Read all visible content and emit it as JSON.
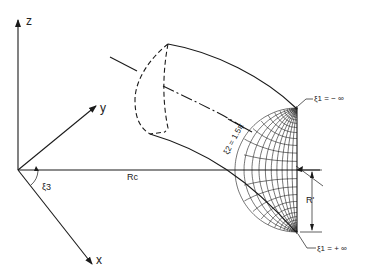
{
  "figure": {
    "axes": {
      "z_label": "z",
      "y_label": "y",
      "x_label": "x"
    },
    "labels": {
      "major_radius": "Rc",
      "angle": "ξ3",
      "minor_radius": "R'",
      "xi2_surface": "ξ2 = 1.5π",
      "xi1_top": "ξ1 = − ∞",
      "xi1_bottom": "ξ1 = + ∞"
    }
  }
}
